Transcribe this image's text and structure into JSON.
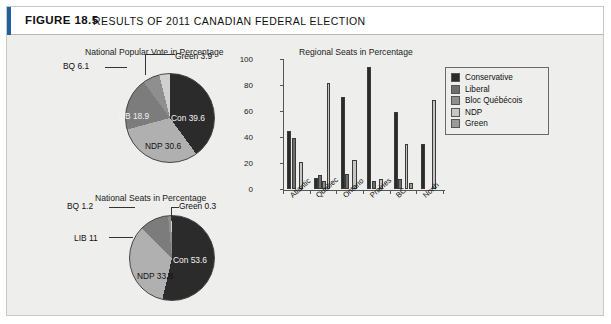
{
  "figure": {
    "label": "FIGURE 18.5",
    "title": "RESULTS OF 2011 CANADIAN FEDERAL ELECTION"
  },
  "colors": {
    "conservative": "#2b2b2b",
    "liberal": "#6e6e6e",
    "bloc": "#8f8f8f",
    "ndp": "#b4b4b4",
    "green": "#a0a0a0",
    "panel_bg": "#eeeeec",
    "axis": "#555555"
  },
  "legend": {
    "position": "right",
    "items": [
      {
        "label": "Conservative",
        "color": "#2b2b2b"
      },
      {
        "label": "Liberal",
        "color": "#6e6e6e"
      },
      {
        "label": "Bloc Québécois",
        "color": "#8f8f8f"
      },
      {
        "label": "NDP",
        "color": "#c6c6c6"
      },
      {
        "label": "Green",
        "color": "#9b9b9b"
      }
    ]
  },
  "chart_data": [
    {
      "type": "pie",
      "title": "National Popular Vote in Percentage",
      "categories": [
        "Con",
        "NDP",
        "LIB",
        "BQ",
        "Green"
      ],
      "values": [
        39.6,
        30.6,
        18.9,
        6.1,
        3.9
      ],
      "labels": [
        "Con 39.6",
        "NDP 30.6",
        "LIB 18.9",
        "BQ 6.1",
        "Green 3.9"
      ],
      "colors": [
        "#2b2b2b",
        "#b0b0b0",
        "#7c7c7c",
        "#8f8f8f",
        "#d0d0d0"
      ]
    },
    {
      "type": "pie",
      "title": "National Seats in Percentage",
      "categories": [
        "Con",
        "NDP",
        "LIB",
        "BQ",
        "Green"
      ],
      "values": [
        53.6,
        33.8,
        11.0,
        1.2,
        0.3
      ],
      "labels": [
        "Con 53.6",
        "NDP 33.8",
        "LIB 11",
        "BQ 1.2",
        "Green 0.3"
      ],
      "colors": [
        "#2b2b2b",
        "#b0b0b0",
        "#7c7c7c",
        "#8f8f8f",
        "#d0d0d0"
      ]
    },
    {
      "type": "bar",
      "title": "Regional Seats in Percentage",
      "xlabel": "",
      "ylabel": "",
      "ylim": [
        0,
        100
      ],
      "yticks": [
        0,
        20,
        40,
        60,
        80,
        100
      ],
      "grid": false,
      "categories": [
        "Atlantic",
        "Quebec",
        "Ontario",
        "Prairies",
        "BC",
        "North"
      ],
      "series": [
        {
          "name": "Conservative",
          "color": "#2b2b2b",
          "values": [
            43,
            7,
            69,
            92,
            58,
            33
          ]
        },
        {
          "name": "Liberal",
          "color": "#6e6e6e",
          "values": [
            38,
            9,
            10,
            5,
            6,
            0
          ]
        },
        {
          "name": "Bloc Québécois",
          "color": "#8f8f8f",
          "values": [
            0,
            5,
            0,
            0,
            0,
            0
          ]
        },
        {
          "name": "NDP",
          "color": "#c6c6c6",
          "values": [
            19,
            80,
            21,
            6,
            33,
            67
          ]
        },
        {
          "name": "Green",
          "color": "#9b9b9b",
          "values": [
            0,
            0,
            0,
            0,
            3,
            0
          ]
        }
      ]
    }
  ]
}
